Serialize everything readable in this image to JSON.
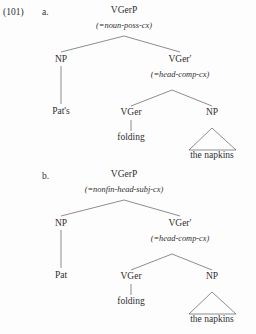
{
  "example": {
    "number": "(101)",
    "items": [
      {
        "marker": "a.",
        "tree": {
          "root_label": "VGerP",
          "root_cx": "(=noun-poss-cx)",
          "left_label": "NP",
          "left_leaf": "Pat's",
          "right_label": "VGer′",
          "right_cx": "(=head-comp-cx)",
          "head_label": "VGer",
          "head_leaf": "folding",
          "comp_label": "NP",
          "comp_leaf": "the napkins"
        }
      },
      {
        "marker": "b.",
        "tree": {
          "root_label": "VGerP",
          "root_cx": "(=nonfin-head-subj-cx)",
          "left_label": "NP",
          "left_leaf": "Pat",
          "right_label": "VGer′",
          "right_cx": "(=head-comp-cx)",
          "head_label": "VGer",
          "head_leaf": "folding",
          "comp_label": "NP",
          "comp_leaf": "the napkins"
        }
      }
    ]
  },
  "colors": {
    "ink": "#2f2f2f",
    "rule": "#5d5d5d",
    "background": "#fdfdfd"
  }
}
